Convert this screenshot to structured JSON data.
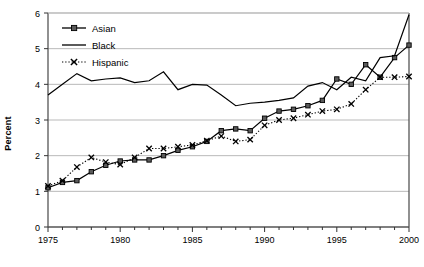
{
  "chart_data": {
    "type": "line",
    "title": "",
    "xlabel": "",
    "ylabel": "Percent",
    "xlim": [
      1975,
      2000
    ],
    "ylim": [
      0,
      6
    ],
    "yticks": [
      0,
      1,
      2,
      3,
      4,
      5,
      6
    ],
    "xticks": [
      1975,
      1980,
      1985,
      1990,
      1995,
      2000
    ],
    "xtick_labels": [
      "1975",
      "1980",
      "1985",
      "1990",
      "1995",
      "2000"
    ],
    "ytick_labels": [
      "0",
      "1",
      "2",
      "3",
      "4",
      "5",
      "6"
    ],
    "grid": "horizontal",
    "minor_xticks_every": 1,
    "legend_position": "top-left",
    "x": [
      1975,
      1976,
      1977,
      1978,
      1979,
      1980,
      1981,
      1982,
      1983,
      1984,
      1985,
      1986,
      1987,
      1988,
      1989,
      1990,
      1991,
      1992,
      1993,
      1994,
      1995,
      1996,
      1997,
      1998,
      1999,
      2000
    ],
    "series": [
      {
        "name": "Asian",
        "marker": "square",
        "line": "solid",
        "color": "#000000",
        "values": [
          1.1,
          1.25,
          1.3,
          1.55,
          1.73,
          1.85,
          1.88,
          1.88,
          2.0,
          2.15,
          2.25,
          2.4,
          2.7,
          2.75,
          2.7,
          3.05,
          3.25,
          3.3,
          3.4,
          3.55,
          4.15,
          4.0,
          4.55,
          4.2,
          4.75,
          5.1
        ]
      },
      {
        "name": "Black",
        "marker": "none",
        "line": "solid",
        "color": "#000000",
        "values": [
          3.7,
          4.0,
          4.3,
          4.1,
          4.15,
          4.18,
          4.05,
          4.1,
          4.35,
          3.85,
          4.0,
          3.98,
          3.7,
          3.4,
          3.47,
          3.5,
          3.55,
          3.62,
          3.95,
          4.05,
          3.85,
          4.2,
          4.1,
          4.75,
          4.8,
          5.95
        ]
      },
      {
        "name": "Hispanic",
        "marker": "x",
        "line": "dotted",
        "color": "#000000",
        "values": [
          1.15,
          1.3,
          1.68,
          1.95,
          1.82,
          1.75,
          1.95,
          2.2,
          2.2,
          2.25,
          2.3,
          2.42,
          2.55,
          2.4,
          2.45,
          2.85,
          3.0,
          3.05,
          3.15,
          3.25,
          3.3,
          3.45,
          3.85,
          4.2,
          4.2,
          4.22
        ]
      }
    ]
  },
  "legend": {
    "items": [
      {
        "label": "Asian"
      },
      {
        "label": "Black"
      },
      {
        "label": "Hispanic"
      }
    ]
  }
}
